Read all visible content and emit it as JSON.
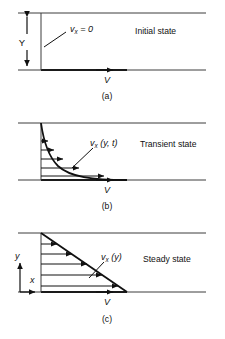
{
  "figure": {
    "panels": [
      {
        "id": "a",
        "caption": "(a)",
        "state_label": "Initial state",
        "profile_label_v": "v",
        "profile_label_sub": "x",
        "profile_label_rest": " = 0",
        "plate_velocity_label": "V",
        "gap_label": "Y",
        "profile_type": "zero",
        "arrow_count": 0
      },
      {
        "id": "b",
        "caption": "(b)",
        "state_label": "Transient state",
        "profile_label_v": "v",
        "profile_label_sub": "x",
        "profile_label_rest": " (y, t)",
        "plate_velocity_label": "V",
        "profile_type": "exponential",
        "arrow_count": 5
      },
      {
        "id": "c",
        "caption": "(c)",
        "state_label": "Steady state",
        "profile_label_v": "v",
        "profile_label_sub": "x",
        "profile_label_rest": " (y)",
        "plate_velocity_label": "V",
        "profile_type": "linear",
        "arrow_count": 5,
        "axis_y_label": "y",
        "axis_x_label": "x"
      }
    ],
    "colors": {
      "background": "#ffffff",
      "ink": "#111111",
      "wall": "#3c3c3c",
      "plate": "#1a1a1a"
    }
  }
}
